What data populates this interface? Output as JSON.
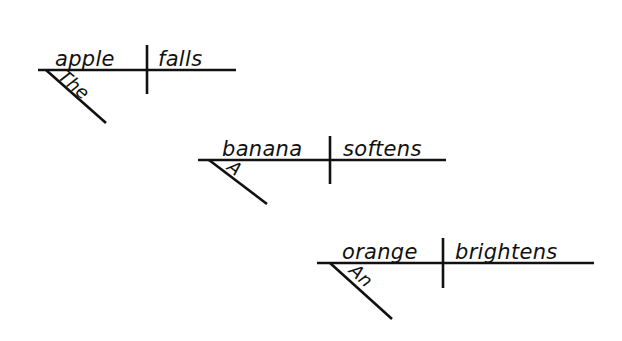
{
  "page": {
    "background_color": "#ffffff",
    "ink_color": "#111111",
    "width": 622,
    "height": 341
  },
  "diagram_type": "sentence-diagram",
  "diagrams": [
    {
      "id": "diagram-1",
      "sentence": "The apple falls",
      "article": "The",
      "subject": "apple",
      "predicate": "falls",
      "baseline": {
        "x1": 38,
        "y1": 70,
        "x2": 236,
        "y2": 70
      },
      "divider": {
        "x1": 147,
        "y1": 45,
        "x2": 147,
        "y2": 94
      },
      "modifier": {
        "x1": 46,
        "y1": 70,
        "x2": 106,
        "y2": 123
      },
      "subject_pos": {
        "x": 55,
        "y": 66
      },
      "predicate_pos": {
        "x": 158,
        "y": 66
      },
      "article_pos": {
        "x": 57,
        "y": 78,
        "rotation": 41
      }
    },
    {
      "id": "diagram-2",
      "sentence": "A banana softens",
      "article": "A",
      "subject": "banana",
      "predicate": "softens",
      "baseline": {
        "x1": 198,
        "y1": 160,
        "x2": 446,
        "y2": 160
      },
      "divider": {
        "x1": 330,
        "y1": 136,
        "x2": 330,
        "y2": 184
      },
      "modifier": {
        "x1": 209,
        "y1": 160,
        "x2": 267,
        "y2": 204
      },
      "subject_pos": {
        "x": 222,
        "y": 156
      },
      "predicate_pos": {
        "x": 343,
        "y": 156
      },
      "article_pos": {
        "x": 226,
        "y": 169,
        "rotation": 38
      }
    },
    {
      "id": "diagram-3",
      "sentence": "An orange brightens",
      "article": "An",
      "subject": "orange",
      "predicate": "brightens",
      "baseline": {
        "x1": 317,
        "y1": 263,
        "x2": 594,
        "y2": 263
      },
      "divider": {
        "x1": 443,
        "y1": 238,
        "x2": 443,
        "y2": 288
      },
      "modifier": {
        "x1": 330,
        "y1": 263,
        "x2": 392,
        "y2": 319
      },
      "subject_pos": {
        "x": 342,
        "y": 259
      },
      "predicate_pos": {
        "x": 455,
        "y": 259
      },
      "article_pos": {
        "x": 348,
        "y": 272,
        "rotation": 42
      }
    }
  ]
}
